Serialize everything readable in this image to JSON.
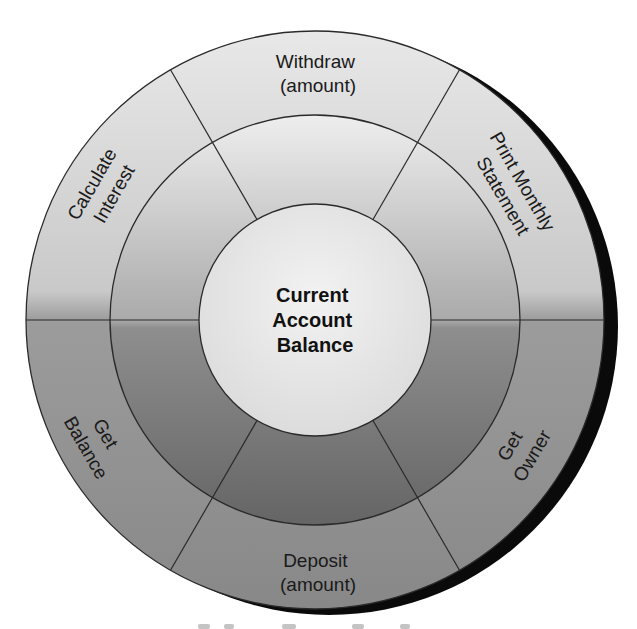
{
  "diagram": {
    "type": "concentric-ring-diagram",
    "center_label": [
      "Current",
      "Account",
      "Balance"
    ],
    "sectors": [
      {
        "id": "withdraw",
        "lines": [
          "Withdraw",
          "(amount)"
        ],
        "angle_deg": 90
      },
      {
        "id": "print-monthly-statement",
        "lines": [
          "Print Monthly",
          "Statement"
        ],
        "angle_deg": 30
      },
      {
        "id": "get-owner",
        "lines": [
          "Get",
          "Owner"
        ],
        "angle_deg": 330
      },
      {
        "id": "deposit",
        "lines": [
          "Deposit",
          "(amount)"
        ],
        "angle_deg": 270
      },
      {
        "id": "get-balance",
        "lines": [
          "Get",
          "Balance"
        ],
        "angle_deg": 210
      },
      {
        "id": "calculate-interest",
        "lines": [
          "Calculate",
          "Interest"
        ],
        "angle_deg": 150
      }
    ],
    "spoke_angles_deg": [
      0,
      60,
      120,
      180,
      240,
      300
    ],
    "colors": {
      "outer_top": "#e4e4e4",
      "outer_bottom": "#8a8a8a",
      "middle_top": "#ececec",
      "middle_bottom": "#6a6a6a",
      "inner": "#e6e6e6",
      "stroke": "#2a2a2a",
      "shadow": "#0a0a0a"
    }
  }
}
